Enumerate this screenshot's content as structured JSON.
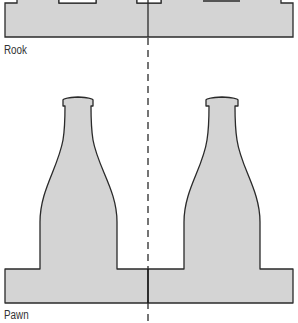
{
  "diagram": {
    "colors": {
      "fill": "#d4d4d4",
      "stroke": "#2a2a2a",
      "centerline": "#3a3a3a",
      "background": "#ffffff"
    },
    "sections": [
      {
        "id": "rook",
        "label": "Rook"
      },
      {
        "id": "pawn",
        "label": "Pawn"
      }
    ],
    "centerline": {
      "style": "dashed",
      "x": 148
    }
  }
}
